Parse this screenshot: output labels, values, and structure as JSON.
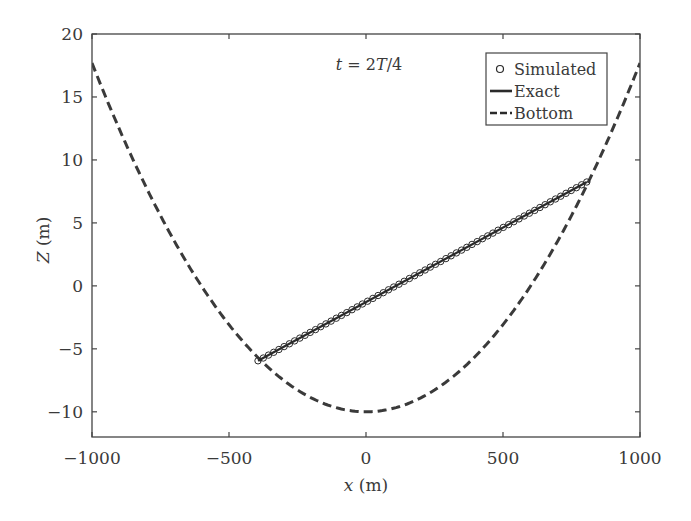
{
  "chart_data": {
    "type": "line",
    "title": "",
    "annotation": {
      "text_parts": [
        {
          "text": "t",
          "italic": true
        },
        {
          "text": " = 2",
          "italic": false
        },
        {
          "text": "T",
          "italic": true
        },
        {
          "text": "/4",
          "italic": false
        }
      ],
      "x": 0,
      "y": 17.5
    },
    "xlabel": {
      "var": "x",
      "unit": " (m)"
    },
    "ylabel": {
      "var": "Z",
      "unit": " (m)"
    },
    "xlim": [
      -1000,
      1000
    ],
    "ylim": [
      -12,
      20
    ],
    "xticks": [
      -1000,
      -500,
      0,
      500,
      1000
    ],
    "xtick_labels": [
      "−1000",
      "−500",
      "0",
      "500",
      "1000"
    ],
    "yticks": [
      -10,
      -5,
      0,
      5,
      10,
      15,
      20
    ],
    "ytick_labels": [
      "−10",
      "−5",
      "0",
      "5",
      "10",
      "15",
      "20"
    ],
    "grid": false,
    "legend_position": "upper right",
    "legend": [
      {
        "label": "Simulated",
        "style": "circle-marker"
      },
      {
        "label": "Exact",
        "style": "solid"
      },
      {
        "label": "Bottom",
        "style": "dashed"
      }
    ],
    "series": [
      {
        "name": "Bottom",
        "style": "dashed",
        "color": "#3a3a3a",
        "description": "Parabolic bottom Z = -10 + 27.7*(x/1000)^2",
        "x": [
          -1000,
          -900,
          -800,
          -700,
          -600,
          -500,
          -400,
          -300,
          -200,
          -100,
          0,
          100,
          200,
          300,
          400,
          500,
          600,
          700,
          800,
          900,
          1000
        ],
        "y": [
          17.7,
          12.44,
          7.73,
          3.57,
          -0.03,
          -3.08,
          -5.57,
          -7.51,
          -8.89,
          -9.72,
          -10.0,
          -9.72,
          -8.89,
          -7.51,
          -5.57,
          -3.08,
          -0.03,
          3.57,
          7.73,
          12.44,
          17.7
        ]
      },
      {
        "name": "Exact",
        "style": "solid",
        "color": "#2a2a2a",
        "description": "Planar free surface from shoreline to shoreline",
        "x": [
          -394,
          806
        ],
        "y": [
          -5.95,
          8.25
        ]
      },
      {
        "name": "Simulated",
        "style": "circle-marker",
        "color": "#2a2a2a",
        "x_start": -394,
        "x_end": 806,
        "count": 64,
        "y_start": -5.95,
        "y_end": 8.25
      }
    ]
  }
}
